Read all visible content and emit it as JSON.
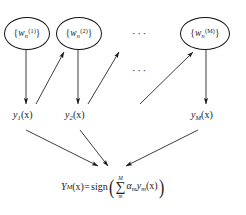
{
  "figure": {
    "kind": "boosting-ensemble-flow-diagram",
    "background_color": "#ffffff",
    "ink_color": "#1a1a1a"
  },
  "weight_nodes": [
    {
      "id": "w1",
      "open_brace": "{",
      "symbol": "w",
      "subscript": "n",
      "superscript": "(1)",
      "close_brace": "}"
    },
    {
      "id": "w2",
      "open_brace": "{",
      "symbol": "w",
      "subscript": "n",
      "superscript": "(2)",
      "close_brace": "}"
    },
    {
      "id": "wM",
      "open_brace": "{",
      "symbol": "w",
      "subscript": "n",
      "superscript": "(M)",
      "close_brace": "}"
    }
  ],
  "ellipses_marks": [
    {
      "id": "top-ellipsis",
      "text": "···"
    },
    {
      "id": "middle-ellipsis",
      "text": "···"
    }
  ],
  "output_labels": [
    {
      "id": "y1",
      "symbol": "y",
      "subscript": "1",
      "arg": "(x)"
    },
    {
      "id": "y2",
      "symbol": "y",
      "subscript": "2",
      "arg": "(x)"
    },
    {
      "id": "yM",
      "symbol": "y",
      "subscript": "M",
      "arg": "(x)"
    }
  ],
  "final_formula": {
    "lhs_symbol": "Y",
    "lhs_subscript": "M",
    "lhs_arg": "(x)",
    "equals": "=",
    "function_name": "sign",
    "open_paren": "(",
    "sum_symbol": "∑",
    "sum_upper": "M",
    "sum_lower": "m",
    "coefficient": "α",
    "coefficient_subscript": "m",
    "term_symbol": "y",
    "term_subscript": "m",
    "term_arg": "(x)",
    "close_paren": ")",
    "plain_text": "Y_M(x) = sign( sum_{m}^{M} alpha_m y_m(x) )"
  },
  "edges": [
    {
      "id": "w1-to-y1",
      "type": "vertical-down",
      "from": "w1",
      "to": "y1"
    },
    {
      "id": "w2-to-y2",
      "type": "vertical-down",
      "from": "w2",
      "to": "y2"
    },
    {
      "id": "wM-to-yM",
      "type": "vertical-down",
      "from": "wM",
      "to": "yM"
    },
    {
      "id": "y1-to-w2",
      "type": "diagonal-up-right",
      "from": "y1",
      "to": "w2"
    },
    {
      "id": "y2-to-next",
      "type": "diagonal-up-right",
      "from": "y2",
      "to": "next-node"
    },
    {
      "id": "prev-to-wM",
      "type": "diagonal-up-right",
      "from": "prev-node",
      "to": "wM"
    },
    {
      "id": "y1-to-final",
      "type": "diagonal-down-right",
      "from": "y1",
      "to": "final-formula"
    },
    {
      "id": "y2-to-final",
      "type": "diagonal-down-right",
      "from": "y2",
      "to": "final-formula"
    },
    {
      "id": "yM-to-final",
      "type": "diagonal-down-left",
      "from": "yM",
      "to": "final-formula"
    }
  ]
}
